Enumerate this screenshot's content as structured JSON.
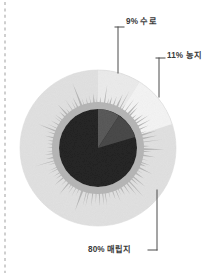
{
  "page": {
    "background_color": "#ffffff",
    "margin_rule": {
      "name": "dashed-margin-line",
      "orientation": "vertical",
      "x": 5,
      "color": "#aaaaaa",
      "style": "dashed"
    }
  },
  "chart_data": {
    "type": "pie",
    "title": "",
    "subtitle": "",
    "xlabel": "",
    "ylabel": "",
    "legend_position": "callout-labels",
    "grid": false,
    "units": "%",
    "center": {
      "x": 98,
      "y": 148
    },
    "rings": [
      {
        "name": "outer-ring",
        "radius": 78
      },
      {
        "name": "starburst-ring",
        "radius": 56
      },
      {
        "name": "inner-core",
        "radius": 39
      }
    ],
    "categories": [
      "수로",
      "농지",
      "매립지"
    ],
    "values": [
      9,
      11,
      80
    ],
    "labels": [
      "9% 수로",
      "11% 농지",
      "80% 매립지"
    ],
    "colors": [
      "#ececec",
      "#f3f3f3",
      "#e0e0e0"
    ],
    "core_colors": [
      "#5a5a5a",
      "#4a4a4a",
      "#262626"
    ],
    "starburst_color": "#b6b6b6",
    "slices": [
      {
        "key": "water",
        "label": "9% 수로",
        "percent_text": "9%",
        "name_text": "수로",
        "value": 9,
        "color": "#ececec"
      },
      {
        "key": "farmland",
        "label": "11% 농지",
        "percent_text": "11%",
        "name_text": "농지",
        "value": 11,
        "color": "#f3f3f3"
      },
      {
        "key": "landfill",
        "label": "80% 매립지",
        "percent_text": "80%",
        "name_text": "매립지",
        "value": 80,
        "color": "#e0e0e0"
      }
    ],
    "callouts": [
      {
        "key": "water",
        "text": "9% 수로",
        "elbow": "top-left",
        "line_color": "#4a4a4a"
      },
      {
        "key": "farmland",
        "text": "11% 농지",
        "elbow": "top-left",
        "line_color": "#4a4a4a"
      },
      {
        "key": "landfill",
        "text": "80% 매립지",
        "elbow": "bottom-right",
        "line_color": "#4a4a4a"
      }
    ]
  }
}
